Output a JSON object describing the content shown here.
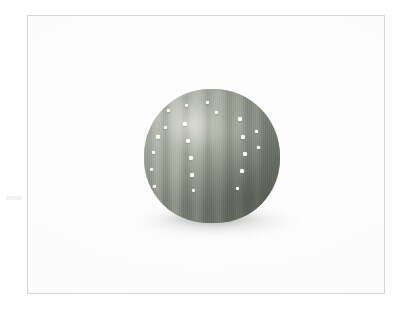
{
  "image": {
    "kind": "photograph",
    "subject_label": "ribbed round cactus with white dots",
    "background_label": "plain white studio background",
    "frame_label": "thin light grey photo border",
    "alt_text": "A small round ribbed cactus, greyish-green, speckled with small white dots, photographed on a white background.",
    "canvas": {
      "width": 414,
      "height": 316
    }
  },
  "colors": {
    "page_background": "#ffffff",
    "frame_border": "#d6d6d6",
    "photo_background": "#fdfdfd",
    "cactus_light": "#bfc2b8",
    "cactus_mid": "#9fa398",
    "cactus_dark": "#7d8378",
    "rib_furrow": "#6f7569",
    "rib_crest": "#c6c9bf",
    "dot": "#fdfdfb",
    "shadow": "#787e76"
  },
  "frame": {
    "left": 27,
    "top": 15,
    "width": 358,
    "height": 279
  },
  "subject": {
    "left": 116,
    "top": 73,
    "width": 136,
    "height": 134,
    "ribs": [
      {
        "left": -4,
        "width": 16,
        "tone": "furrow",
        "opacity": 0.26
      },
      {
        "left": 7,
        "width": 13,
        "tone": "crest",
        "opacity": 0.3
      },
      {
        "left": 17,
        "width": 9,
        "tone": "furrow",
        "opacity": 0.38
      },
      {
        "left": 24,
        "width": 16,
        "tone": "crest",
        "opacity": 0.34
      },
      {
        "left": 38,
        "width": 8,
        "tone": "furrow",
        "opacity": 0.42
      },
      {
        "left": 45,
        "width": 17,
        "tone": "crest",
        "opacity": 0.3
      },
      {
        "left": 60,
        "width": 8,
        "tone": "furrow",
        "opacity": 0.4
      },
      {
        "left": 67,
        "width": 16,
        "tone": "crest",
        "opacity": 0.26
      },
      {
        "left": 81,
        "width": 8,
        "tone": "furrow",
        "opacity": 0.4
      },
      {
        "left": 88,
        "width": 14,
        "tone": "crest",
        "opacity": 0.22
      },
      {
        "left": 100,
        "width": 8,
        "tone": "furrow",
        "opacity": 0.38
      },
      {
        "left": 107,
        "width": 12,
        "tone": "crest",
        "opacity": 0.2
      },
      {
        "left": 118,
        "width": 9,
        "tone": "furrow",
        "opacity": 0.34
      }
    ],
    "dots": [
      {
        "left": 12,
        "top": 46,
        "size": 3.5
      },
      {
        "left": 8,
        "top": 62,
        "size": 3.0
      },
      {
        "left": 6,
        "top": 79,
        "size": 3.4
      },
      {
        "left": 9,
        "top": 96,
        "size": 3.0
      },
      {
        "left": 23,
        "top": 20,
        "size": 3.2
      },
      {
        "left": 20,
        "top": 37,
        "size": 2.8
      },
      {
        "left": 41,
        "top": 15,
        "size": 3.4
      },
      {
        "left": 39,
        "top": 33,
        "size": 3.6
      },
      {
        "left": 42,
        "top": 50,
        "size": 4.0
      },
      {
        "left": 45,
        "top": 67,
        "size": 4.2
      },
      {
        "left": 46,
        "top": 84,
        "size": 3.8
      },
      {
        "left": 48,
        "top": 100,
        "size": 3.4
      },
      {
        "left": 62,
        "top": 12,
        "size": 3.0
      },
      {
        "left": 71,
        "top": 22,
        "size": 3.2
      },
      {
        "left": 94,
        "top": 28,
        "size": 3.6
      },
      {
        "left": 97,
        "top": 46,
        "size": 4.4
      },
      {
        "left": 99,
        "top": 63,
        "size": 3.8
      },
      {
        "left": 96,
        "top": 80,
        "size": 3.6
      },
      {
        "left": 92,
        "top": 98,
        "size": 3.2
      },
      {
        "left": 111,
        "top": 41,
        "size": 3.2
      },
      {
        "left": 113,
        "top": 57,
        "size": 3.0
      }
    ]
  }
}
